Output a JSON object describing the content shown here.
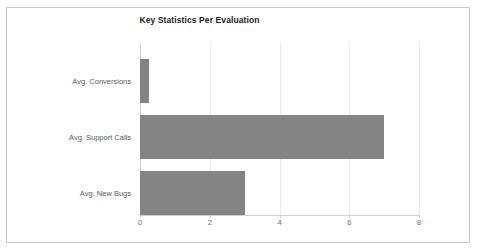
{
  "chart_data": {
    "type": "bar",
    "orientation": "horizontal",
    "title": "Key Statistics Per Evaluation",
    "xlabel": "",
    "ylabel": "",
    "categories": [
      "Avg. Conversions",
      "Avg. Support Calls",
      "Avg. New Bugs"
    ],
    "values": [
      0.25,
      7.0,
      3.0
    ],
    "xlim": [
      0,
      8
    ],
    "xticks": [
      "0",
      "2",
      "4",
      "6",
      "8"
    ],
    "xtick_values": [
      0,
      2,
      4,
      6,
      8
    ],
    "grid": "vertical",
    "legend": "none",
    "bar_color": "#848484",
    "gridline_color": "#e9e9e9",
    "axis_color": "#cfcfcf",
    "background_color": "#ffffff",
    "border_color": "#c9c9c9",
    "title_color": "#1c1c1c",
    "label_color": "#595959"
  }
}
